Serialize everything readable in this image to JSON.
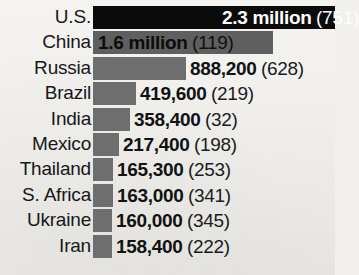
{
  "chart_data": {
    "type": "bar",
    "title": "",
    "subtitle": "",
    "xlabel": "",
    "ylabel": "",
    "grid": false,
    "legend": "none",
    "orientation": "horizontal",
    "categories": [
      "U.S.",
      "China",
      "Russia",
      "Brazil",
      "India",
      "Mexico",
      "Thailand",
      "S. Africa",
      "Ukraine",
      "Iran"
    ],
    "values": [
      2300000,
      1600000,
      888200,
      419600,
      358400,
      217400,
      165300,
      163000,
      160000,
      158400
    ],
    "value_labels": [
      "2.3 million",
      "1.6 million",
      "888,200",
      "419,600",
      "358,400",
      "217,400",
      "165,300",
      "163,000",
      "160,000",
      "158,400"
    ],
    "secondary_values": [
      751,
      119,
      628,
      219,
      32,
      198,
      253,
      341,
      345,
      222
    ],
    "secondary_labels": [
      "(751)",
      "(119)",
      "(628)",
      "(219)",
      "(32)",
      "(198)",
      "(253)",
      "(341)",
      "(345)",
      "(222)"
    ],
    "xlim": [
      0,
      2300000
    ],
    "colors": {
      "bar_primary": "#0b0b0b",
      "bar_secondary": "#6e6e6e",
      "background": "#f1f0ed",
      "text": "#16171a",
      "text_inverse": "#fdfdfb"
    }
  },
  "rows": [
    {
      "label": "U.S.",
      "value_label": "2.3 million",
      "secondary_label": "(751)",
      "bar_style": "dark",
      "label_placement": "inside",
      "bar_px": 242,
      "value_left_px": 129
    },
    {
      "label": "China",
      "value_label": "1.6 million",
      "secondary_label": "(119)",
      "bar_style": "mid",
      "label_placement": "inside",
      "bar_px": 180,
      "value_left_px": 5
    },
    {
      "label": "Russia",
      "value_label": "888,200",
      "secondary_label": "(628)",
      "bar_style": "plain",
      "label_placement": "outside",
      "bar_px": 93,
      "value_left_px": 97
    },
    {
      "label": "Brazil",
      "value_label": "419,600",
      "secondary_label": "(219)",
      "bar_style": "plain",
      "label_placement": "outside",
      "bar_px": 43,
      "value_left_px": 47
    },
    {
      "label": "India",
      "value_label": "358,400",
      "secondary_label": "(32)",
      "bar_style": "plain",
      "label_placement": "outside",
      "bar_px": 37,
      "value_left_px": 41
    },
    {
      "label": "Mexico",
      "value_label": "217,400",
      "secondary_label": "(198)",
      "bar_style": "plain",
      "label_placement": "outside",
      "bar_px": 26,
      "value_left_px": 30
    },
    {
      "label": "Thailand",
      "value_label": "165,300",
      "secondary_label": "(253)",
      "bar_style": "plain",
      "label_placement": "outside",
      "bar_px": 20,
      "value_left_px": 24
    },
    {
      "label": "S. Africa",
      "value_label": "163,000",
      "secondary_label": "(341)",
      "bar_style": "plain",
      "label_placement": "outside",
      "bar_px": 20,
      "value_left_px": 24
    },
    {
      "label": "Ukraine",
      "value_label": "160,000",
      "secondary_label": "(345)",
      "bar_style": "plain",
      "label_placement": "outside",
      "bar_px": 19,
      "value_left_px": 23
    },
    {
      "label": "Iran",
      "value_label": "158,400",
      "secondary_label": "(222)",
      "bar_style": "plain",
      "label_placement": "outside",
      "bar_px": 19,
      "value_left_px": 23
    }
  ]
}
